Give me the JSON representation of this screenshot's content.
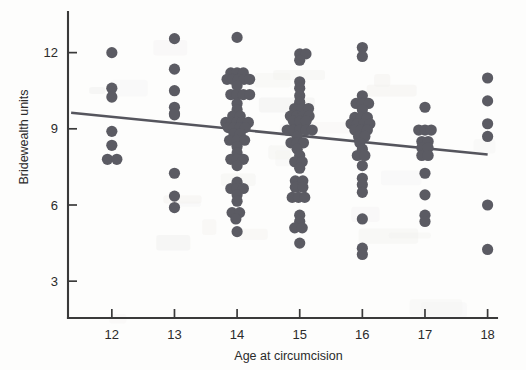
{
  "figure": {
    "width": 526,
    "height": 370,
    "background_color": "#fdfdfc",
    "point_color": "#5b5b63",
    "line_color": "#55555d",
    "axis_color": "#3a3a3a"
  },
  "chart_data": {
    "type": "scatter",
    "title": "",
    "xlabel": "Age at circumcision",
    "ylabel": "Bridewealth units",
    "xlim": [
      11.3,
      18.15
    ],
    "ylim": [
      1.55,
      13.6
    ],
    "xticks": [
      12,
      13,
      14,
      15,
      16,
      17,
      18
    ],
    "yticks": [
      3,
      6,
      9,
      12
    ],
    "xtick_labels": [
      "12",
      "13",
      "14",
      "15",
      "16",
      "17",
      "18"
    ],
    "ytick_labels": [
      "3",
      "6",
      "9",
      "12"
    ],
    "grid": false,
    "legend": null,
    "marker": "circle",
    "marker_size": 5.6,
    "jitter": "horizontal",
    "trend_line": {
      "type": "linear-fit",
      "x_start": 11.35,
      "y_start": 9.63,
      "x_end": 18.0,
      "y_end": 7.99,
      "slope": -0.247,
      "intercept": 12.43
    },
    "series": [
      {
        "name": "Individuals",
        "points": [
          {
            "x": 12.0,
            "y": 12.0
          },
          {
            "x": 12.0,
            "y": 10.6
          },
          {
            "x": 12.0,
            "y": 10.25
          },
          {
            "x": 12.0,
            "y": 8.9
          },
          {
            "x": 12.0,
            "y": 8.35
          },
          {
            "x": 11.93,
            "y": 7.8
          },
          {
            "x": 12.08,
            "y": 7.8
          },
          {
            "x": 13.0,
            "y": 12.55
          },
          {
            "x": 13.0,
            "y": 11.35
          },
          {
            "x": 13.0,
            "y": 10.5
          },
          {
            "x": 13.0,
            "y": 9.85
          },
          {
            "x": 13.0,
            "y": 9.6
          },
          {
            "x": 13.0,
            "y": 9.55
          },
          {
            "x": 13.0,
            "y": 7.25
          },
          {
            "x": 13.0,
            "y": 6.35
          },
          {
            "x": 13.0,
            "y": 5.9
          },
          {
            "x": 14.0,
            "y": 12.6
          },
          {
            "x": 13.9,
            "y": 11.2
          },
          {
            "x": 14.0,
            "y": 11.2
          },
          {
            "x": 14.1,
            "y": 11.2
          },
          {
            "x": 13.84,
            "y": 10.95
          },
          {
            "x": 13.93,
            "y": 10.95
          },
          {
            "x": 14.02,
            "y": 10.95
          },
          {
            "x": 14.11,
            "y": 10.95
          },
          {
            "x": 14.2,
            "y": 10.95
          },
          {
            "x": 14.0,
            "y": 10.7
          },
          {
            "x": 13.9,
            "y": 10.35
          },
          {
            "x": 14.0,
            "y": 10.35
          },
          {
            "x": 14.1,
            "y": 10.35
          },
          {
            "x": 14.2,
            "y": 10.35
          },
          {
            "x": 14.0,
            "y": 10.0
          },
          {
            "x": 14.0,
            "y": 9.75
          },
          {
            "x": 13.93,
            "y": 9.5
          },
          {
            "x": 14.05,
            "y": 9.5
          },
          {
            "x": 13.82,
            "y": 9.25
          },
          {
            "x": 13.92,
            "y": 9.25
          },
          {
            "x": 14.0,
            "y": 9.25
          },
          {
            "x": 14.08,
            "y": 9.25
          },
          {
            "x": 14.18,
            "y": 9.25
          },
          {
            "x": 13.86,
            "y": 9.05
          },
          {
            "x": 13.95,
            "y": 9.05
          },
          {
            "x": 14.04,
            "y": 9.05
          },
          {
            "x": 14.13,
            "y": 9.05
          },
          {
            "x": 13.95,
            "y": 8.8
          },
          {
            "x": 14.05,
            "y": 8.8
          },
          {
            "x": 13.88,
            "y": 8.55
          },
          {
            "x": 14.0,
            "y": 8.55
          },
          {
            "x": 14.12,
            "y": 8.55
          },
          {
            "x": 14.0,
            "y": 8.3
          },
          {
            "x": 14.0,
            "y": 8.05
          },
          {
            "x": 13.9,
            "y": 7.8
          },
          {
            "x": 14.0,
            "y": 7.8
          },
          {
            "x": 14.1,
            "y": 7.8
          },
          {
            "x": 14.0,
            "y": 7.55
          },
          {
            "x": 14.0,
            "y": 6.9
          },
          {
            "x": 13.9,
            "y": 6.65
          },
          {
            "x": 14.0,
            "y": 6.65
          },
          {
            "x": 14.1,
            "y": 6.65
          },
          {
            "x": 14.0,
            "y": 6.4
          },
          {
            "x": 14.0,
            "y": 6.15
          },
          {
            "x": 13.92,
            "y": 5.7
          },
          {
            "x": 14.04,
            "y": 5.7
          },
          {
            "x": 13.98,
            "y": 5.45
          },
          {
            "x": 14.0,
            "y": 4.95
          },
          {
            "x": 15.0,
            "y": 11.95
          },
          {
            "x": 15.1,
            "y": 11.95
          },
          {
            "x": 15.0,
            "y": 11.7
          },
          {
            "x": 15.0,
            "y": 10.85
          },
          {
            "x": 15.0,
            "y": 10.6
          },
          {
            "x": 15.0,
            "y": 10.3
          },
          {
            "x": 15.0,
            "y": 10.05
          },
          {
            "x": 14.92,
            "y": 9.8
          },
          {
            "x": 15.04,
            "y": 9.8
          },
          {
            "x": 15.14,
            "y": 9.8
          },
          {
            "x": 14.85,
            "y": 9.5
          },
          {
            "x": 14.95,
            "y": 9.5
          },
          {
            "x": 15.05,
            "y": 9.5
          },
          {
            "x": 15.15,
            "y": 9.5
          },
          {
            "x": 14.9,
            "y": 9.3
          },
          {
            "x": 15.0,
            "y": 9.3
          },
          {
            "x": 15.1,
            "y": 9.3
          },
          {
            "x": 14.8,
            "y": 8.95
          },
          {
            "x": 14.9,
            "y": 8.95
          },
          {
            "x": 15.0,
            "y": 8.95
          },
          {
            "x": 15.1,
            "y": 8.95
          },
          {
            "x": 15.2,
            "y": 8.95
          },
          {
            "x": 14.96,
            "y": 8.7
          },
          {
            "x": 14.86,
            "y": 8.45
          },
          {
            "x": 14.96,
            "y": 8.45
          },
          {
            "x": 15.06,
            "y": 8.45
          },
          {
            "x": 14.96,
            "y": 8.2
          },
          {
            "x": 15.0,
            "y": 7.95
          },
          {
            "x": 14.92,
            "y": 7.7
          },
          {
            "x": 15.04,
            "y": 7.7
          },
          {
            "x": 15.0,
            "y": 7.45
          },
          {
            "x": 14.93,
            "y": 6.95
          },
          {
            "x": 15.05,
            "y": 6.95
          },
          {
            "x": 14.93,
            "y": 6.7
          },
          {
            "x": 15.05,
            "y": 6.7
          },
          {
            "x": 14.88,
            "y": 6.3
          },
          {
            "x": 14.98,
            "y": 6.3
          },
          {
            "x": 15.08,
            "y": 6.3
          },
          {
            "x": 15.0,
            "y": 5.6
          },
          {
            "x": 15.0,
            "y": 5.35
          },
          {
            "x": 14.92,
            "y": 5.1
          },
          {
            "x": 15.04,
            "y": 5.1
          },
          {
            "x": 15.0,
            "y": 4.5
          },
          {
            "x": 16.0,
            "y": 12.2
          },
          {
            "x": 16.0,
            "y": 11.85
          },
          {
            "x": 16.0,
            "y": 10.3
          },
          {
            "x": 15.9,
            "y": 10.0
          },
          {
            "x": 16.0,
            "y": 10.0
          },
          {
            "x": 16.1,
            "y": 10.0
          },
          {
            "x": 16.0,
            "y": 9.75
          },
          {
            "x": 15.88,
            "y": 9.45
          },
          {
            "x": 15.98,
            "y": 9.45
          },
          {
            "x": 16.08,
            "y": 9.45
          },
          {
            "x": 15.82,
            "y": 9.2
          },
          {
            "x": 15.92,
            "y": 9.2
          },
          {
            "x": 16.02,
            "y": 9.2
          },
          {
            "x": 16.12,
            "y": 9.2
          },
          {
            "x": 15.88,
            "y": 8.95
          },
          {
            "x": 15.98,
            "y": 8.95
          },
          {
            "x": 16.08,
            "y": 8.95
          },
          {
            "x": 15.94,
            "y": 8.7
          },
          {
            "x": 16.04,
            "y": 8.7
          },
          {
            "x": 15.96,
            "y": 8.45
          },
          {
            "x": 16.0,
            "y": 8.2
          },
          {
            "x": 15.92,
            "y": 7.95
          },
          {
            "x": 16.04,
            "y": 7.95
          },
          {
            "x": 16.0,
            "y": 7.55
          },
          {
            "x": 16.0,
            "y": 7.05
          },
          {
            "x": 16.0,
            "y": 6.8
          },
          {
            "x": 16.0,
            "y": 6.5
          },
          {
            "x": 16.0,
            "y": 5.45
          },
          {
            "x": 16.0,
            "y": 4.3
          },
          {
            "x": 16.0,
            "y": 4.05
          },
          {
            "x": 17.0,
            "y": 9.85
          },
          {
            "x": 16.9,
            "y": 8.95
          },
          {
            "x": 17.0,
            "y": 8.95
          },
          {
            "x": 17.1,
            "y": 8.95
          },
          {
            "x": 16.95,
            "y": 8.5
          },
          {
            "x": 17.05,
            "y": 8.5
          },
          {
            "x": 16.95,
            "y": 8.25
          },
          {
            "x": 17.05,
            "y": 8.25
          },
          {
            "x": 16.95,
            "y": 7.95
          },
          {
            "x": 17.05,
            "y": 7.95
          },
          {
            "x": 17.0,
            "y": 7.25
          },
          {
            "x": 17.0,
            "y": 6.4
          },
          {
            "x": 17.0,
            "y": 5.6
          },
          {
            "x": 17.0,
            "y": 5.35
          },
          {
            "x": 18.0,
            "y": 11.0
          },
          {
            "x": 18.0,
            "y": 10.1
          },
          {
            "x": 18.0,
            "y": 9.2
          },
          {
            "x": 18.0,
            "y": 8.7
          },
          {
            "x": 18.0,
            "y": 6.0
          },
          {
            "x": 18.0,
            "y": 4.25
          }
        ]
      }
    ]
  }
}
